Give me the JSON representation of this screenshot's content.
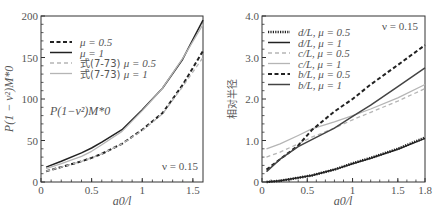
{
  "chart_data": [
    {
      "type": "line",
      "title": "",
      "xlabel": "a0/l",
      "ylabel": "P(1 − ν²)M*0",
      "xlim": [
        0,
        1.6
      ],
      "ylim": [
        0,
        200
      ],
      "xticks": [
        "0",
        "0.5",
        "1",
        "1.5"
      ],
      "yticks": [
        "0",
        "50",
        "100",
        "150",
        "200"
      ],
      "grid": false,
      "legend_position": "upper left",
      "annotations": [
        "P(1−ν²)M*0",
        "ν = 0.15"
      ],
      "x": [
        0.05,
        0.2,
        0.4,
        0.5,
        0.6,
        0.8,
        1.0,
        1.2,
        1.4,
        1.6
      ],
      "series": [
        {
          "name": "μ = 0.5",
          "style": "dashed-black",
          "values": [
            13,
            18,
            25,
            29,
            34,
            46,
            63,
            83,
            117,
            158
          ]
        },
        {
          "name": "μ = 1",
          "style": "solid-black",
          "values": [
            18,
            25,
            35,
            41,
            48,
            63,
            87,
            113,
            148,
            195
          ]
        },
        {
          "name": "式(7-73) μ = 0.5",
          "style": "dashed-light",
          "values": [
            13,
            18,
            25,
            29,
            34,
            46,
            62,
            82,
            115,
            150
          ]
        },
        {
          "name": "式(7-73) μ = 1",
          "style": "solid-light",
          "values": [
            16,
            22,
            31,
            37,
            45,
            61,
            86,
            113,
            149,
            190
          ]
        }
      ]
    },
    {
      "type": "line",
      "title": "",
      "xlabel": "a0/l",
      "ylabel": "相对半径",
      "xlim": [
        0,
        1.8
      ],
      "ylim": [
        0,
        4.0
      ],
      "xticks": [
        "0",
        "0.5",
        "1",
        "1.5",
        "1.8"
      ],
      "yticks": [
        "0",
        "1.0",
        "2.0",
        "3.0",
        "4.0"
      ],
      "grid": false,
      "legend_position": "upper left",
      "annotations": [
        "ν = 0.15"
      ],
      "x": [
        0.05,
        0.2,
        0.4,
        0.55,
        0.8,
        1.0,
        1.2,
        1.5,
        1.8
      ],
      "series": [
        {
          "name": "d/L, μ = 0.5",
          "style": "dotted-black",
          "values": [
            0.0,
            0.03,
            0.1,
            0.16,
            0.3,
            0.45,
            0.58,
            0.8,
            1.07
          ]
        },
        {
          "name": "d/L, μ = 1",
          "style": "solid-black",
          "values": [
            0.0,
            0.03,
            0.1,
            0.16,
            0.3,
            0.44,
            0.57,
            0.79,
            1.05
          ]
        },
        {
          "name": "c/L, μ = 0.5",
          "style": "dashed-light",
          "values": [
            0.6,
            0.72,
            0.92,
            1.08,
            1.3,
            1.5,
            1.68,
            1.95,
            2.25
          ]
        },
        {
          "name": "c/L, μ = 1",
          "style": "solid-light",
          "values": [
            0.8,
            0.92,
            1.12,
            1.28,
            1.45,
            1.6,
            1.76,
            2.03,
            2.35
          ]
        },
        {
          "name": "b/L, μ = 0.5",
          "style": "dashed-black",
          "values": [
            0.3,
            0.55,
            0.88,
            1.25,
            1.7,
            2.0,
            2.35,
            2.82,
            3.3
          ]
        },
        {
          "name": "b/L, μ = 1",
          "style": "solid-dark",
          "values": [
            0.25,
            0.55,
            0.85,
            1.02,
            1.3,
            1.58,
            1.85,
            2.3,
            2.75
          ]
        }
      ]
    }
  ],
  "left_panel": {
    "ylabel": "P(1 − ν²)M*0",
    "xlabel": "a0/l",
    "inset_label": "P(1−ν²)M*0",
    "nu_label": "ν = 0.15",
    "legend": [
      {
        "label_prefix": "",
        "label": "μ = 0.5"
      },
      {
        "label_prefix": "",
        "label": "μ = 1"
      },
      {
        "label_prefix": "式(7-73) ",
        "label": "μ = 0.5"
      },
      {
        "label_prefix": "式(7-73) ",
        "label": "μ = 1"
      }
    ]
  },
  "right_panel": {
    "ylabel": "相对半径",
    "xlabel": "a0/l",
    "nu_label": "ν = 0.15",
    "legend": [
      {
        "label": "d/L, μ = 0.5"
      },
      {
        "label": "d/L, μ = 1"
      },
      {
        "label": "c/L, μ = 0.5"
      },
      {
        "label": "c/L, μ = 1"
      },
      {
        "label": "b/L, μ = 0.5"
      },
      {
        "label": "b/L, μ = 1"
      }
    ]
  },
  "colors": {
    "black": "#222222",
    "dark": "#444444",
    "light": "#b5b5b5",
    "axis": "#333333"
  }
}
